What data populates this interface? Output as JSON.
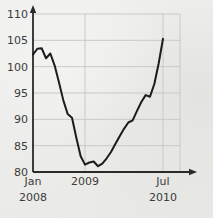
{
  "chart_data": {
    "type": "line",
    "title": "",
    "subtitle": "",
    "xlabel": "",
    "ylabel": "",
    "ylim": [
      80,
      110
    ],
    "yticks": [
      80,
      85,
      90,
      95,
      100,
      105,
      110
    ],
    "ytick_labels": [
      "80",
      "85",
      "90",
      "95",
      "100",
      "105",
      "110"
    ],
    "xlim": [
      "2008-01",
      "2010-07"
    ],
    "xticks": [
      "2008-01",
      "2009-01",
      "2010-07"
    ],
    "xtick_labels": [
      {
        "line1": "Jan",
        "line2": "2008"
      },
      {
        "line1": "2009",
        "line2": ""
      },
      {
        "line1": "Jul",
        "line2": "2010"
      }
    ],
    "grid": {
      "horizontal": true,
      "vertical": true
    },
    "legend": {
      "visible": false,
      "position": "none"
    },
    "axis_arrows": {
      "x": true,
      "y": true
    },
    "series": [
      {
        "name": "index",
        "color": "#1c1c1c",
        "x": [
          "2008-01",
          "2008-02",
          "2008-03",
          "2008-04",
          "2008-05",
          "2008-06",
          "2008-07",
          "2008-08",
          "2008-09",
          "2008-10",
          "2008-11",
          "2008-12",
          "2009-01",
          "2009-02",
          "2009-03",
          "2009-04",
          "2009-05",
          "2009-06",
          "2009-07",
          "2009-08",
          "2009-09",
          "2009-10",
          "2009-11",
          "2009-12",
          "2010-01",
          "2010-02",
          "2010-03",
          "2010-04",
          "2010-05",
          "2010-06",
          "2010-07"
        ],
        "values": [
          102.3,
          103.4,
          103.5,
          101.6,
          102.5,
          100.2,
          97.0,
          93.6,
          91.0,
          90.3,
          86.5,
          83.0,
          81.4,
          81.8,
          82.0,
          81.1,
          81.6,
          82.6,
          83.8,
          85.3,
          86.8,
          88.2,
          89.4,
          89.8,
          91.6,
          93.3,
          94.6,
          94.3,
          96.7,
          100.6,
          105.3
        ]
      }
    ],
    "annotations": []
  },
  "colors": {
    "line": "#1c1c1c",
    "axis": "#2a2a2a",
    "grid": "#c9c9c7",
    "text": "#3b3b3b",
    "background": "#eeeeec"
  }
}
